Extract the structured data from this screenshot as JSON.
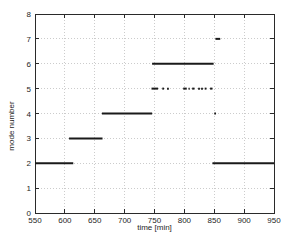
{
  "figure": {
    "background": "#ffffff",
    "axis_color": "#2a2a2a",
    "grid_color": "#cccccc",
    "line_color": "#1a1a1a",
    "tick_label_color": "#1e1e1e"
  },
  "chart_data": {
    "type": "line",
    "title": "",
    "xlabel": "time [min]",
    "ylabel": "mode number",
    "xlim": [
      550,
      950
    ],
    "ylim": [
      0,
      8
    ],
    "xticks": [
      550,
      600,
      650,
      700,
      750,
      800,
      850,
      900,
      950
    ],
    "yticks": [
      0,
      1,
      2,
      3,
      4,
      5,
      6,
      7,
      8
    ],
    "grid": true,
    "legend_position": "none",
    "series": [
      {
        "name": "active-mode-segments",
        "style": "horizontal-segments",
        "segments": [
          {
            "mode": 2,
            "start": 550,
            "end": 614
          },
          {
            "mode": 3,
            "start": 607,
            "end": 663
          },
          {
            "mode": 4,
            "start": 662,
            "end": 746
          },
          {
            "mode": 6,
            "start": 746,
            "end": 849
          },
          {
            "mode": 5,
            "start": 745,
            "end": 756
          },
          {
            "mode": 5,
            "start": 763,
            "end": 766
          },
          {
            "mode": 5,
            "start": 771,
            "end": 774
          },
          {
            "mode": 5,
            "start": 798,
            "end": 804
          },
          {
            "mode": 5,
            "start": 807,
            "end": 809
          },
          {
            "mode": 5,
            "start": 813,
            "end": 817
          },
          {
            "mode": 5,
            "start": 823,
            "end": 826
          },
          {
            "mode": 5,
            "start": 828,
            "end": 831
          },
          {
            "mode": 5,
            "start": 834,
            "end": 837
          },
          {
            "mode": 5,
            "start": 843,
            "end": 847
          },
          {
            "mode": 7,
            "start": 852,
            "end": 860
          },
          {
            "mode": 4,
            "start": 850,
            "end": 853
          },
          {
            "mode": 2,
            "start": 847,
            "end": 950
          }
        ]
      }
    ]
  }
}
